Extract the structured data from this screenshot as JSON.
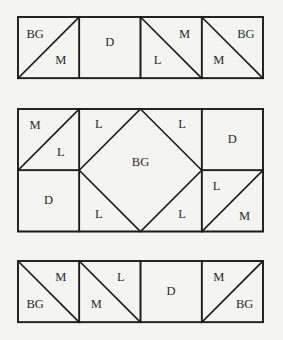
{
  "diagram": {
    "colors": {
      "background": "#f4f4f1",
      "line": "#1c1c1c",
      "text": "#2a2a2a"
    },
    "cell_size": 61.25,
    "x0": 18,
    "sections": [
      {
        "id": "top-row",
        "y0": 17,
        "rows": 1,
        "units": [
          {
            "col": 0,
            "row": 0,
            "type": "hst",
            "diag": "up",
            "labels": [
              {
                "t": "BG",
                "dx": 0.28,
                "dy": 0.3
              },
              {
                "t": "M",
                "dx": 0.7,
                "dy": 0.72
              }
            ]
          },
          {
            "col": 1,
            "row": 0,
            "type": "square",
            "labels": [
              {
                "t": "D",
                "dx": 0.5,
                "dy": 0.42
              }
            ]
          },
          {
            "col": 2,
            "row": 0,
            "type": "hst",
            "diag": "down",
            "labels": [
              {
                "t": "M",
                "dx": 0.72,
                "dy": 0.3
              },
              {
                "t": "L",
                "dx": 0.28,
                "dy": 0.72
              }
            ]
          },
          {
            "col": 3,
            "row": 0,
            "type": "hst",
            "diag": "down",
            "labels": [
              {
                "t": "BG",
                "dx": 0.72,
                "dy": 0.3
              },
              {
                "t": "M",
                "dx": 0.28,
                "dy": 0.72
              }
            ]
          }
        ]
      },
      {
        "id": "middle-row",
        "y0": 109,
        "rows": 2,
        "units": [
          {
            "col": 0,
            "row": 0,
            "type": "hst",
            "diag": "up",
            "labels": [
              {
                "t": "M",
                "dx": 0.28,
                "dy": 0.28
              },
              {
                "t": "L",
                "dx": 0.7,
                "dy": 0.72
              }
            ]
          },
          {
            "col": 0,
            "row": 1,
            "type": "square",
            "labels": [
              {
                "t": "D",
                "dx": 0.5,
                "dy": 0.5
              }
            ]
          },
          {
            "col": 1,
            "row": 0,
            "type": "square-in-square",
            "span": 2,
            "labels": [
              {
                "t": "L",
                "dx": 0.16,
                "dy": 0.13
              },
              {
                "t": "L",
                "dx": 0.84,
                "dy": 0.13
              },
              {
                "t": "BG",
                "dx": 0.5,
                "dy": 0.44
              },
              {
                "t": "L",
                "dx": 0.16,
                "dy": 0.87
              },
              {
                "t": "L",
                "dx": 0.84,
                "dy": 0.87
              }
            ]
          },
          {
            "col": 3,
            "row": 0,
            "type": "square",
            "labels": [
              {
                "t": "D",
                "dx": 0.5,
                "dy": 0.5
              }
            ]
          },
          {
            "col": 3,
            "row": 1,
            "type": "hst",
            "diag": "up",
            "labels": [
              {
                "t": "L",
                "dx": 0.24,
                "dy": 0.28
              },
              {
                "t": "M",
                "dx": 0.7,
                "dy": 0.76
              }
            ]
          }
        ]
      },
      {
        "id": "bottom-row",
        "y0": 261,
        "rows": 1,
        "units": [
          {
            "col": 0,
            "row": 0,
            "type": "hst",
            "diag": "down",
            "labels": [
              {
                "t": "M",
                "dx": 0.7,
                "dy": 0.28
              },
              {
                "t": "BG",
                "dx": 0.28,
                "dy": 0.72
              }
            ]
          },
          {
            "col": 1,
            "row": 0,
            "type": "hst",
            "diag": "down",
            "labels": [
              {
                "t": "L",
                "dx": 0.68,
                "dy": 0.28
              },
              {
                "t": "M",
                "dx": 0.28,
                "dy": 0.72
              }
            ]
          },
          {
            "col": 2,
            "row": 0,
            "type": "square",
            "labels": [
              {
                "t": "D",
                "dx": 0.5,
                "dy": 0.5
              }
            ]
          },
          {
            "col": 3,
            "row": 0,
            "type": "hst",
            "diag": "up",
            "labels": [
              {
                "t": "M",
                "dx": 0.28,
                "dy": 0.28
              },
              {
                "t": "BG",
                "dx": 0.7,
                "dy": 0.72
              }
            ]
          }
        ]
      }
    ],
    "legend_codes": [
      "BG",
      "D",
      "L",
      "M"
    ]
  }
}
